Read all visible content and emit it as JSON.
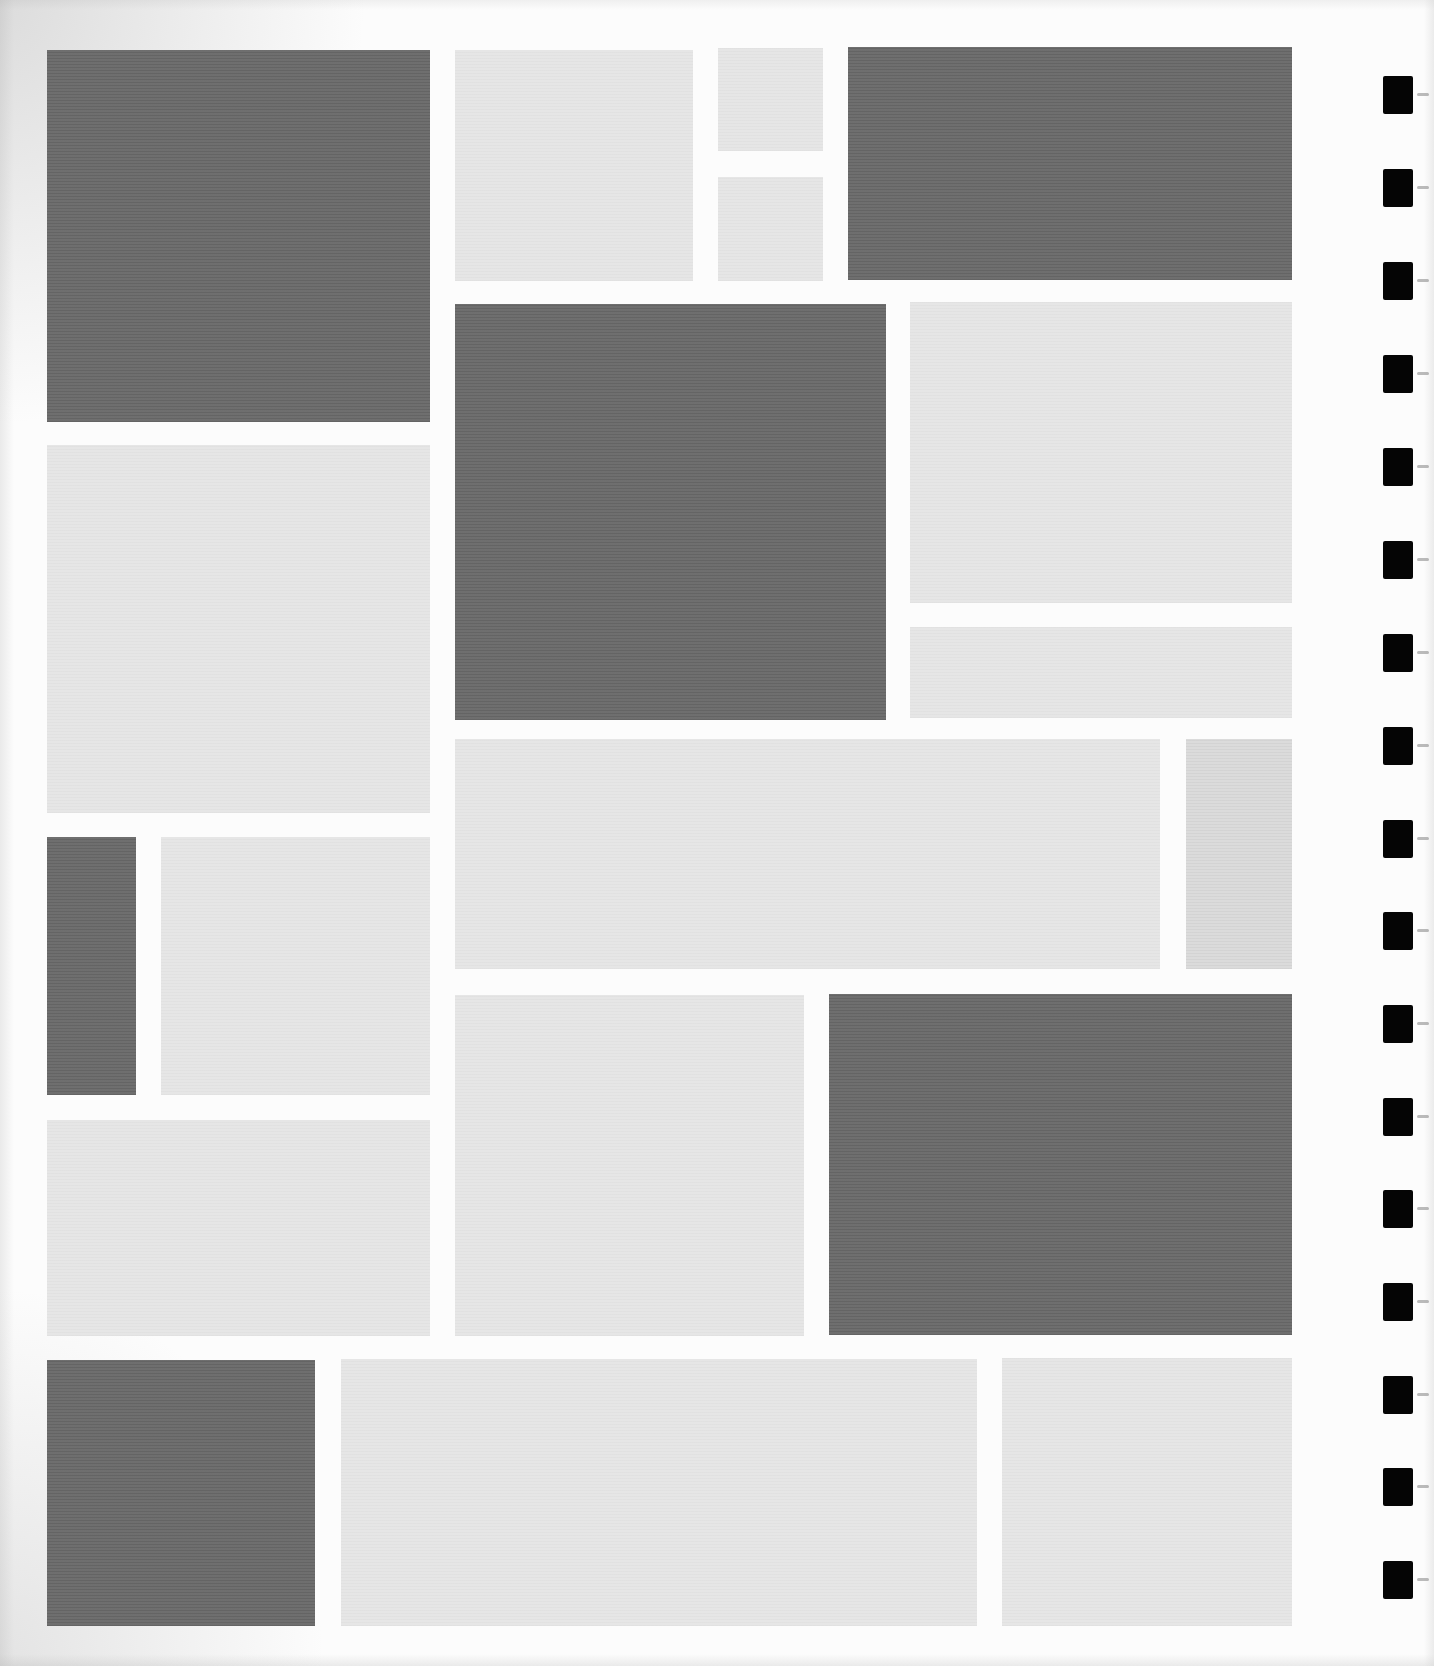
{
  "page": {
    "width": 1434,
    "height": 1666,
    "background": "#fcfcfc",
    "colors": {
      "dark_block": "#6a6a6a",
      "light_block": "#e5e5e5",
      "mid_block": "#dadada",
      "binding_hole": "#050505"
    }
  },
  "blocks": [
    {
      "name": "block-r1-left-dark",
      "tone": "dark",
      "x": 47,
      "y": 50,
      "w": 383,
      "h": 372
    },
    {
      "name": "block-r1-light",
      "tone": "light",
      "x": 455,
      "y": 50,
      "w": 238,
      "h": 231
    },
    {
      "name": "block-r1-small-top",
      "tone": "light",
      "x": 718,
      "y": 48,
      "w": 105,
      "h": 103
    },
    {
      "name": "block-r1-small-bottom",
      "tone": "light",
      "x": 718,
      "y": 177,
      "w": 105,
      "h": 104
    },
    {
      "name": "block-r1-right-dark",
      "tone": "dark",
      "x": 848,
      "y": 47,
      "w": 444,
      "h": 233
    },
    {
      "name": "block-center-dark",
      "tone": "dark",
      "x": 455,
      "y": 304,
      "w": 431,
      "h": 416
    },
    {
      "name": "block-right-light-tall",
      "tone": "light",
      "x": 910,
      "y": 302,
      "w": 382,
      "h": 301
    },
    {
      "name": "block-right-light-strip",
      "tone": "light",
      "x": 910,
      "y": 627,
      "w": 382,
      "h": 91
    },
    {
      "name": "block-left-light-tall",
      "tone": "light",
      "x": 47,
      "y": 445,
      "w": 383,
      "h": 368
    },
    {
      "name": "block-center-light-wide",
      "tone": "light",
      "x": 455,
      "y": 739,
      "w": 705,
      "h": 230
    },
    {
      "name": "block-right-mid-narrow",
      "tone": "mid",
      "x": 1186,
      "y": 739,
      "w": 106,
      "h": 230
    },
    {
      "name": "block-left-dark-narrow",
      "tone": "dark",
      "x": 47,
      "y": 837,
      "w": 89,
      "h": 258
    },
    {
      "name": "block-left-light-square",
      "tone": "light",
      "x": 161,
      "y": 837,
      "w": 269,
      "h": 258
    },
    {
      "name": "block-center-light-lower",
      "tone": "light",
      "x": 455,
      "y": 995,
      "w": 349,
      "h": 341
    },
    {
      "name": "block-right-dark-lower",
      "tone": "dark",
      "x": 829,
      "y": 994,
      "w": 463,
      "h": 341
    },
    {
      "name": "block-left-light-lower",
      "tone": "light",
      "x": 47,
      "y": 1120,
      "w": 383,
      "h": 216
    },
    {
      "name": "block-bottom-left-dark",
      "tone": "dark",
      "x": 47,
      "y": 1360,
      "w": 268,
      "h": 266
    },
    {
      "name": "block-bottom-center-light",
      "tone": "light",
      "x": 341,
      "y": 1359,
      "w": 636,
      "h": 267
    },
    {
      "name": "block-bottom-right-light",
      "tone": "light",
      "x": 1002,
      "y": 1358,
      "w": 290,
      "h": 268
    }
  ],
  "binding_holes": {
    "x": 1383,
    "y_positions": [
      76,
      169,
      262,
      355,
      448,
      541,
      634,
      727,
      820,
      912,
      1005,
      1098,
      1190,
      1283,
      1376,
      1468,
      1561
    ]
  }
}
